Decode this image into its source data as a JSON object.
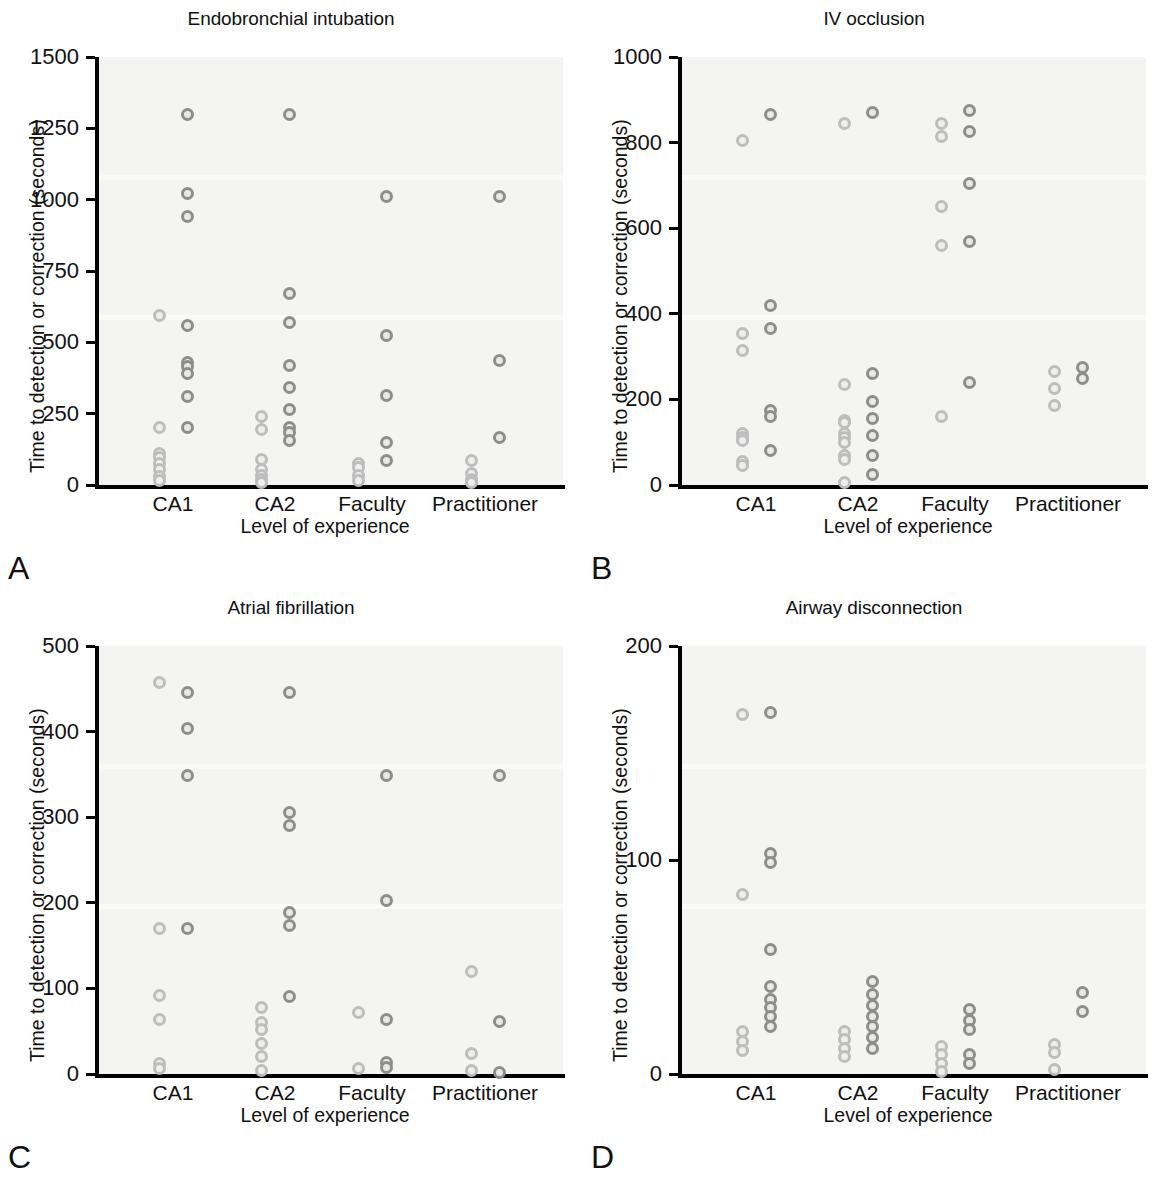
{
  "figure": {
    "axis_title_y": "Time to detection or correction (seconds)",
    "axis_title_x": "Level of experience",
    "categories": [
      "CA1",
      "CA2",
      "Faculty",
      "Practitioner"
    ],
    "marker_color_dark": "#8d8d8d",
    "marker_color_light": "#bdbdbd",
    "plot_background": "#f4f4f2",
    "axis_color": "#000000"
  },
  "panels": [
    {
      "letter": "A",
      "title": "Endobronchial intubation",
      "ylim": [
        0,
        1500
      ],
      "yticks": [
        0,
        250,
        500,
        750,
        1000,
        1250,
        1500
      ],
      "ytick_labels": [
        "0",
        "250",
        "500",
        "750",
        "1000",
        "1250",
        "1500"
      ]
    },
    {
      "letter": "B",
      "title": "IV occlusion",
      "ylim": [
        0,
        1000
      ],
      "yticks": [
        0,
        200,
        400,
        600,
        800,
        1000
      ],
      "ytick_labels": [
        "0",
        "200",
        "400",
        "600",
        "800",
        "1000"
      ]
    },
    {
      "letter": "C",
      "title": "Atrial fibrillation",
      "ylim": [
        0,
        500
      ],
      "yticks": [
        0,
        100,
        200,
        300,
        400,
        500
      ],
      "ytick_labels": [
        "0",
        "100",
        "200",
        "300",
        "400",
        "500"
      ]
    },
    {
      "letter": "D",
      "title": "Airway disconnection",
      "ylim": [
        0,
        200
      ],
      "yticks": [
        0,
        100,
        200
      ],
      "ytick_labels": [
        "0",
        "100",
        "200"
      ]
    }
  ],
  "chart_data": [
    {
      "type": "scatter",
      "panel": "A",
      "title": "Endobronchial intubation",
      "xlabel": "Level of experience",
      "ylabel": "Time to detection or correction (seconds)",
      "categories": [
        "CA1",
        "CA2",
        "Faculty",
        "Practitioner"
      ],
      "ylim": [
        0,
        1500
      ],
      "yticks": [
        0,
        250,
        500,
        750,
        1000,
        1250,
        1500
      ],
      "grid": false,
      "legend": "none",
      "series": [
        {
          "name": "detection",
          "offset": "left",
          "shade": "light",
          "points": [
            {
              "category": "CA1",
              "values": [
                595,
                200,
                110,
                95,
                75,
                55,
                30,
                15
              ]
            },
            {
              "category": "CA2",
              "values": [
                240,
                195,
                90,
                55,
                35,
                20,
                10
              ]
            },
            {
              "category": "Faculty",
              "values": [
                75,
                60,
                35,
                15
              ]
            },
            {
              "category": "Practitioner",
              "values": [
                85,
                40,
                20,
                10
              ]
            }
          ]
        },
        {
          "name": "correction",
          "offset": "right",
          "shade": "dark",
          "points": [
            {
              "category": "CA1",
              "values": [
                1300,
                1020,
                940,
                560,
                430,
                415,
                390,
                310,
                200
              ]
            },
            {
              "category": "CA2",
              "values": [
                1300,
                670,
                570,
                420,
                340,
                265,
                200,
                185,
                155
              ]
            },
            {
              "category": "Faculty",
              "values": [
                1010,
                525,
                315,
                150,
                85
              ]
            },
            {
              "category": "Practitioner",
              "values": [
                1010,
                435,
                165
              ]
            }
          ]
        }
      ]
    },
    {
      "type": "scatter",
      "panel": "B",
      "title": "IV occlusion",
      "xlabel": "Level of experience",
      "ylabel": "Time to detection or correction (seconds)",
      "categories": [
        "CA1",
        "CA2",
        "Faculty",
        "Practitioner"
      ],
      "ylim": [
        0,
        1000
      ],
      "yticks": [
        0,
        200,
        400,
        600,
        800,
        1000
      ],
      "grid": false,
      "legend": "none",
      "series": [
        {
          "name": "detection",
          "offset": "left",
          "shade": "light",
          "points": [
            {
              "category": "CA1",
              "values": [
                805,
                355,
                315,
                120,
                110,
                105,
                55,
                45
              ]
            },
            {
              "category": "CA2",
              "values": [
                845,
                235,
                150,
                145,
                120,
                110,
                100,
                70,
                60,
                5
              ]
            },
            {
              "category": "Faculty",
              "values": [
                845,
                815,
                650,
                560,
                160
              ]
            },
            {
              "category": "Practitioner",
              "values": [
                265,
                225,
                185
              ]
            }
          ]
        },
        {
          "name": "correction",
          "offset": "right",
          "shade": "dark",
          "points": [
            {
              "category": "CA1",
              "values": [
                865,
                420,
                365,
                175,
                160,
                80
              ]
            },
            {
              "category": "CA2",
              "values": [
                870,
                260,
                195,
                155,
                115,
                70,
                25
              ]
            },
            {
              "category": "Faculty",
              "values": [
                875,
                825,
                705,
                570,
                240
              ]
            },
            {
              "category": "Practitioner",
              "values": [
                275,
                250
              ]
            }
          ]
        }
      ]
    },
    {
      "type": "scatter",
      "panel": "C",
      "title": "Atrial fibrillation",
      "xlabel": "Level of experience",
      "ylabel": "Time to detection or correction (seconds)",
      "categories": [
        "CA1",
        "CA2",
        "Faculty",
        "Practitioner"
      ],
      "ylim": [
        0,
        500
      ],
      "yticks": [
        0,
        100,
        200,
        300,
        400,
        500
      ],
      "grid": false,
      "legend": "none",
      "series": [
        {
          "name": "detection",
          "offset": "left",
          "shade": "light",
          "points": [
            {
              "category": "CA1",
              "values": [
                457,
                170,
                92,
                64,
                12,
                7
              ]
            },
            {
              "category": "CA2",
              "values": [
                78,
                60,
                52,
                36,
                20,
                4
              ]
            },
            {
              "category": "Faculty",
              "values": [
                72,
                6
              ]
            },
            {
              "category": "Practitioner",
              "values": [
                120,
                24,
                4
              ]
            }
          ]
        },
        {
          "name": "correction",
          "offset": "right",
          "shade": "dark",
          "points": [
            {
              "category": "CA1",
              "values": [
                446,
                404,
                349,
                170
              ]
            },
            {
              "category": "CA2",
              "values": [
                446,
                306,
                290,
                189,
                173,
                90
              ]
            },
            {
              "category": "Faculty",
              "values": [
                349,
                203,
                64,
                13,
                8
              ]
            },
            {
              "category": "Practitioner",
              "values": [
                349,
                61,
                2
              ]
            }
          ]
        }
      ]
    },
    {
      "type": "scatter",
      "panel": "D",
      "title": "Airway disconnection",
      "xlabel": "Level of experience",
      "ylabel": "Time to detection or correction (seconds)",
      "categories": [
        "CA1",
        "CA2",
        "Faculty",
        "Practitioner"
      ],
      "ylim": [
        0,
        200
      ],
      "yticks": [
        0,
        100,
        200
      ],
      "grid": false,
      "legend": "none",
      "series": [
        {
          "name": "detection",
          "offset": "left",
          "shade": "light",
          "points": [
            {
              "category": "CA1",
              "values": [
                168,
                84,
                20,
                15,
                11
              ]
            },
            {
              "category": "CA2",
              "values": [
                20,
                16,
                12,
                8
              ]
            },
            {
              "category": "Faculty",
              "values": [
                13,
                9,
                5,
                1
              ]
            },
            {
              "category": "Practitioner",
              "values": [
                14,
                10,
                2
              ]
            }
          ]
        },
        {
          "name": "correction",
          "offset": "right",
          "shade": "dark",
          "points": [
            {
              "category": "CA1",
              "values": [
                169,
                103,
                99,
                58,
                41,
                35,
                31,
                27,
                22
              ]
            },
            {
              "category": "CA2",
              "values": [
                43,
                37,
                32,
                27,
                22,
                17,
                12
              ]
            },
            {
              "category": "Faculty",
              "values": [
                30,
                25,
                21,
                9,
                5
              ]
            },
            {
              "category": "Practitioner",
              "values": [
                38,
                29
              ]
            }
          ]
        }
      ]
    }
  ]
}
